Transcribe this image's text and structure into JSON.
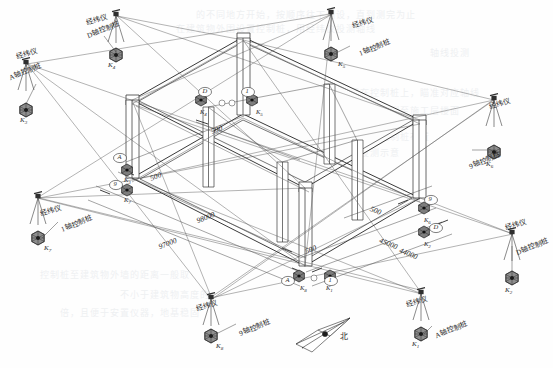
{
  "drawing": {
    "title": "建筑物轴线控制桩与经纬仪投测示意图",
    "type": "isometric-survey-layout",
    "north_label": "北",
    "line_color": "#3a3a3a",
    "text_color": "#2b2b2b"
  },
  "terms": {
    "theodolite": "经纬仪",
    "control_pile_A": "A轴控制桩",
    "control_pile_D": "D轴控制桩",
    "control_pile_1": "1轴控制桩",
    "control_pile_9": "9轴控制桩",
    "control_pile_D_l1": "D轴",
    "control_pile_D_l2": "控制桩"
  },
  "stations": [
    {
      "id": "st-top-left",
      "instrument": "经纬仪",
      "pile": "D轴控制桩",
      "mark": "K",
      "sub": "4",
      "x": 115,
      "y": 12,
      "lx": 86,
      "ly": 14,
      "plx": 86,
      "ply": 24,
      "mkx": 108,
      "mky": 61
    },
    {
      "id": "st-left-upper",
      "instrument": "经纬仪",
      "pile": "A轴控制桩",
      "mark": "K",
      "sub": "3",
      "x": 24,
      "y": 60,
      "lx": 16,
      "ly": 48,
      "plx": 8,
      "ply": 66,
      "mkx": 20,
      "mky": 116
    },
    {
      "id": "st-top-right",
      "instrument": "经纬仪",
      "pile": "1轴控制桩",
      "mark": "K",
      "sub": "5",
      "x": 330,
      "y": 10,
      "lx": 352,
      "ly": 17,
      "plx": 358,
      "ply": 42,
      "mkx": 338,
      "mky": 60
    },
    {
      "id": "st-right-upper",
      "instrument": "经纬仪",
      "pile": "9轴控制桩",
      "mark": "K",
      "sub": "6",
      "x": 493,
      "y": 96,
      "lx": 489,
      "ly": 98,
      "plx": 468,
      "ply": 155,
      "mkx": 486,
      "mky": 160
    },
    {
      "id": "st-right-lower",
      "instrument": "经纬仪",
      "pile": "D轴控制桩",
      "mark": "K",
      "sub": "2",
      "x": 512,
      "y": 230,
      "lx": 505,
      "ly": 219,
      "plx": 515,
      "ply": 241,
      "mkx": 505,
      "mky": 286
    },
    {
      "id": "st-left-lower",
      "instrument": "经纬仪",
      "pile": "1轴控制桩",
      "mark": "K",
      "sub": "7",
      "x": 37,
      "y": 194,
      "lx": 40,
      "ly": 205,
      "plx": 60,
      "ply": 218,
      "mkx": 44,
      "mky": 244
    },
    {
      "id": "st-bottom-left",
      "instrument": "经纬仪",
      "pile": "9轴控制桩",
      "mark": "K",
      "sub": "8",
      "x": 210,
      "y": 295,
      "lx": 196,
      "ly": 300,
      "plx": 238,
      "ply": 322,
      "mkx": 216,
      "mky": 342
    },
    {
      "id": "st-bottom-right",
      "instrument": "经纬仪",
      "pile": "A轴控制桩",
      "mark": "K",
      "sub": "1",
      "x": 420,
      "y": 290,
      "lx": 406,
      "ly": 296,
      "plx": 434,
      "ply": 324,
      "mkx": 412,
      "mky": 340
    }
  ],
  "dimensions": [
    {
      "id": "dim-98000",
      "value": "98000",
      "x": 196,
      "y": 213,
      "rot": -22
    },
    {
      "id": "dim-97000",
      "value": "97000",
      "x": 158,
      "y": 239,
      "rot": -22
    },
    {
      "id": "dim-45000",
      "value": "45000",
      "x": 379,
      "y": 239,
      "rot": 22
    },
    {
      "id": "dim-44000",
      "value": "44000",
      "x": 399,
      "y": 249,
      "rot": 22
    },
    {
      "id": "dim-500-a",
      "value": "500",
      "x": 211,
      "y": 125,
      "rot": -22
    },
    {
      "id": "dim-500-b",
      "value": "500",
      "x": 150,
      "y": 172,
      "rot": -22
    },
    {
      "id": "dim-500-c",
      "value": "500",
      "x": 305,
      "y": 245,
      "rot": -22
    },
    {
      "id": "dim-500-d",
      "value": "500",
      "x": 370,
      "y": 206,
      "rot": 22
    }
  ],
  "axis_bubbles": [
    {
      "id": "bub-D-top",
      "label": "D",
      "x": 205,
      "y": 92
    },
    {
      "id": "bub-1-top",
      "label": "1",
      "x": 248,
      "y": 92
    },
    {
      "id": "bub-A-left",
      "label": "A",
      "x": 120,
      "y": 158
    },
    {
      "id": "bub-9-left",
      "label": "9",
      "x": 116,
      "y": 185
    },
    {
      "id": "bub-9-right",
      "label": "9",
      "x": 431,
      "y": 200
    },
    {
      "id": "bub-D-right",
      "label": "D",
      "x": 436,
      "y": 228
    },
    {
      "id": "bub-A-bot",
      "label": "A",
      "x": 288,
      "y": 281
    },
    {
      "id": "bub-1-bot",
      "label": "1",
      "x": 331,
      "y": 281
    }
  ],
  "corner_marks": [
    {
      "id": "cm-1",
      "mark": "K",
      "sub": "4",
      "x": 200,
      "y": 108
    },
    {
      "id": "cm-2",
      "mark": "K",
      "sub": "5",
      "x": 256,
      "y": 108
    },
    {
      "id": "cm-3",
      "mark": "K",
      "sub": "3",
      "x": 124,
      "y": 176
    },
    {
      "id": "cm-4",
      "mark": "K",
      "sub": "7",
      "x": 124,
      "y": 196
    },
    {
      "id": "cm-5",
      "mark": "K",
      "sub": "6",
      "x": 424,
      "y": 216
    },
    {
      "id": "cm-6",
      "mark": "K",
      "sub": "2",
      "x": 424,
      "y": 240
    },
    {
      "id": "cm-7",
      "mark": "K",
      "sub": "8",
      "x": 300,
      "y": 284
    },
    {
      "id": "cm-8",
      "mark": "K",
      "sub": "1",
      "x": 326,
      "y": 284
    }
  ],
  "bleed_text": [
    {
      "t": "的不同地方开始，按顺序往下测设，直到测完为止",
      "x": 196,
      "y": 8
    },
    {
      "t": "在建筑物外围设置控制桩，用经纬仪投测轴线",
      "x": 176,
      "y": 22
    },
    {
      "t": "轴线投测",
      "x": 430,
      "y": 46
    },
    {
      "t": "将经纬仪安置在控制桩上，瞄准对应轴线",
      "x": 300,
      "y": 86
    },
    {
      "t": "标志点，向上投测至施工层楼面",
      "x": 320,
      "y": 104
    },
    {
      "t": "图中所示为高层建筑轴线控制桩布置",
      "x": 270,
      "y": 130
    },
    {
      "t": "与经纬仪投测示意",
      "x": 320,
      "y": 146
    },
    {
      "t": "控制桩至建筑物外墙的距离一般取",
      "x": 40,
      "y": 268
    },
    {
      "t": "不小于建筑物高度的",
      "x": 120,
      "y": 288
    },
    {
      "t": "倍，且便于安置仪器，地基稳固",
      "x": 60,
      "y": 306
    }
  ]
}
